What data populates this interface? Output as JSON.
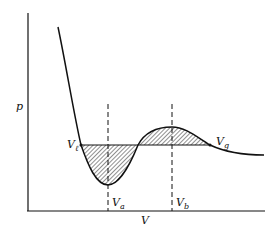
{
  "diagram": {
    "axes": {
      "x_label": "V",
      "y_label": "p"
    },
    "labels": {
      "v_l": {
        "main": "V",
        "sub": "ℓ"
      },
      "v_g": {
        "main": "V",
        "sub": "g"
      },
      "v_a": {
        "main": "V",
        "sub": "a"
      },
      "v_b": {
        "main": "V",
        "sub": "b"
      }
    },
    "colors": {
      "line": "#111111",
      "hatch": "#333333",
      "background": "#ffffff"
    }
  }
}
